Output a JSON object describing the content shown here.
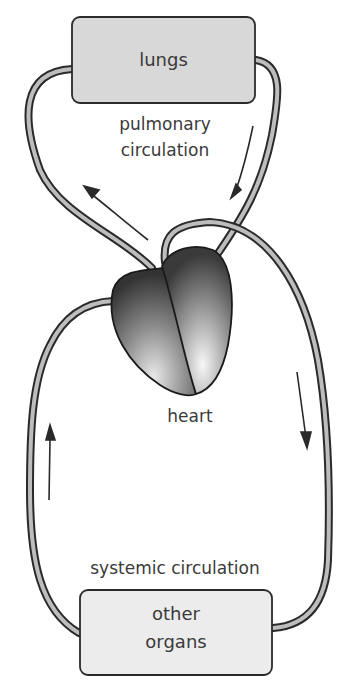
{
  "diagram": {
    "nodes": {
      "lungs": "lungs",
      "heart": "heart",
      "other_organs_line1": "other",
      "other_organs_line2": "organs"
    },
    "labels": {
      "pulmonary_line1": "pulmonary",
      "pulmonary_line2": "circulation",
      "systemic": "systemic circulation"
    },
    "colors": {
      "tube_outline": "#2a2a2a",
      "tube_fill": "#b8b8b8",
      "box_fill": "#dcdcdc",
      "organs_fill": "#ececec",
      "arrow": "#2a2a2a",
      "text": "#3a3a3a"
    }
  }
}
